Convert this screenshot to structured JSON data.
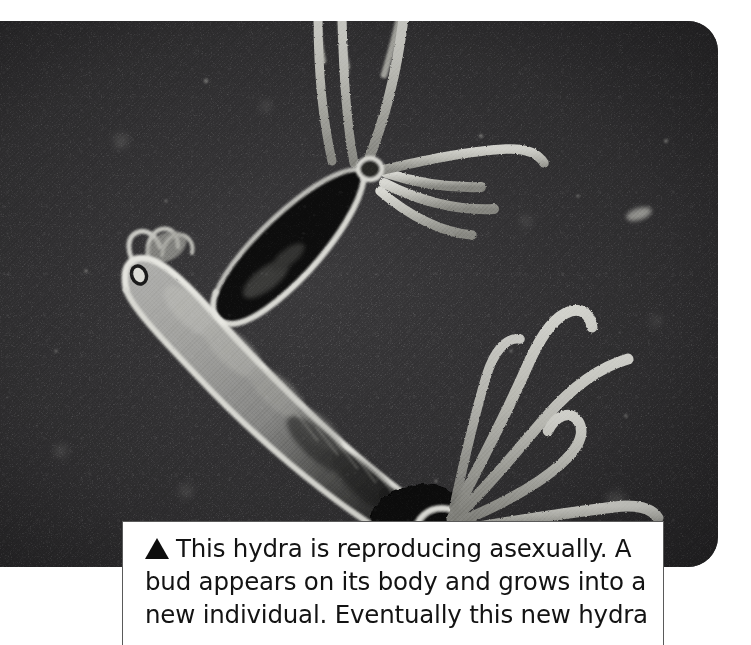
{
  "figure": {
    "kind": "photograph-with-caption",
    "photo": {
      "alt_description": "Black and white microscope photograph of a hydra with a bud growing from its body",
      "background_color": "#333234",
      "body_color": "#9a9a9a",
      "outline_color": "#e8e8e4",
      "bud_color": "#0d0d0d",
      "corner_radius_px": 30
    },
    "caption": {
      "marker": "triangle-up-marker",
      "lines": [
        "This hydra is reproducing asexually. A",
        "bud appears on its body and grows into a",
        "new individual. Eventually this new hydra"
      ],
      "line1": "This hydra is reproducing asexually. A",
      "line2": "bud appears on its body and grows into a",
      "line3": "new individual. Eventually this new hydra",
      "text_color": "#131313",
      "box_background": "#ffffff",
      "box_border_color": "#5a5a5a"
    }
  }
}
